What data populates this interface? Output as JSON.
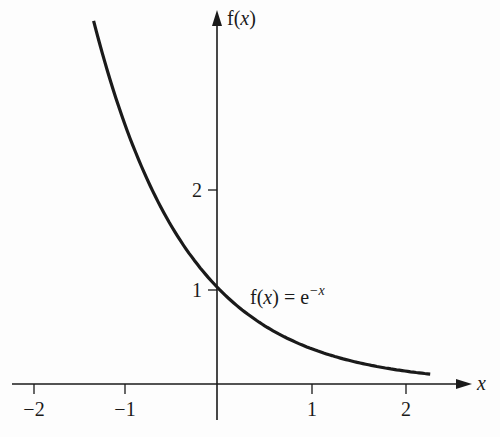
{
  "chart_data": {
    "type": "line",
    "title": "",
    "function_label": "f(x) = e^(-x)",
    "xlabel": "x",
    "ylabel": "f(x)",
    "xlim": [
      -2.2,
      2.7
    ],
    "ylim": [
      -0.5,
      4.0
    ],
    "x_ticks": [
      -2,
      -1,
      1,
      2
    ],
    "x_tick_labels": [
      "−2",
      "−1",
      "1",
      "2"
    ],
    "y_ticks": [
      1,
      2
    ],
    "y_tick_labels": [
      "1",
      "2"
    ],
    "grid": false,
    "legend": null,
    "series": [
      {
        "name": "f(x) = e^(-x)",
        "x": [
          -1.32,
          -1.0,
          -0.5,
          0.0,
          0.5,
          1.0,
          1.5,
          2.0,
          2.28
        ],
        "values": [
          3.74,
          2.72,
          1.65,
          1.0,
          0.61,
          0.37,
          0.22,
          0.14,
          0.1
        ]
      }
    ],
    "annotations": [
      {
        "text": "f(x) = e⁻ˣ",
        "x": 0.1,
        "y": 0.9
      }
    ]
  },
  "labels": {
    "x_axis": "x",
    "y_axis_f": "f(",
    "y_axis_x": "x",
    "y_axis_close": ")",
    "tick_x_m2": "−2",
    "tick_x_m1": "−1",
    "tick_x_1": "1",
    "tick_x_2": "2",
    "tick_y_1": "1",
    "tick_y_2": "2",
    "curve_f": "f(",
    "curve_x": "x",
    "curve_eq": ") = e",
    "curve_exp": "−x"
  }
}
